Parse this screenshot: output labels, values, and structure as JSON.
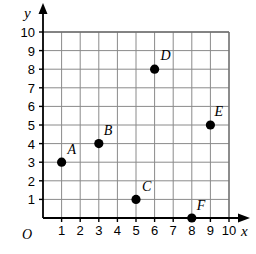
{
  "figure": {
    "type": "coordinate-grid",
    "background_color": "#ffffff",
    "grid_color": "#8a8a8a",
    "axis_color": "#000000",
    "point_color": "#000000",
    "origin_label": "O",
    "x_axis_label": "x",
    "y_axis_label": "y"
  },
  "chart_data": {
    "type": "scatter",
    "title": "",
    "xlabel": "x",
    "ylabel": "y",
    "xlim": [
      0,
      10
    ],
    "ylim": [
      0,
      10
    ],
    "grid": true,
    "legend": "none",
    "origin_label": "O",
    "x_ticks": [
      "1",
      "2",
      "3",
      "4",
      "5",
      "6",
      "7",
      "8",
      "9",
      "10"
    ],
    "y_ticks": [
      "1",
      "2",
      "3",
      "4",
      "5",
      "6",
      "7",
      "8",
      "9",
      "10"
    ],
    "points": [
      {
        "label": "A",
        "x": 1,
        "y": 3,
        "label_dx": 6,
        "label_dy": -8
      },
      {
        "label": "B",
        "x": 3,
        "y": 4,
        "label_dx": 5,
        "label_dy": -9
      },
      {
        "label": "C",
        "x": 5,
        "y": 1,
        "label_dx": 6,
        "label_dy": -8
      },
      {
        "label": "D",
        "x": 6,
        "y": 8,
        "label_dx": 6,
        "label_dy": -9
      },
      {
        "label": "E",
        "x": 9,
        "y": 5,
        "label_dx": 4,
        "label_dy": -9
      },
      {
        "label": "F",
        "x": 8,
        "y": 0,
        "label_dx": 5,
        "label_dy": -8
      }
    ]
  }
}
